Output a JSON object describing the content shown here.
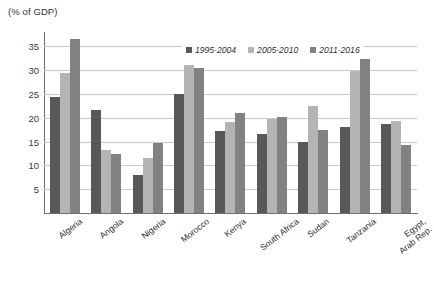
{
  "chart_data": {
    "type": "bar",
    "title": "",
    "ylabel": "(% of GDP)",
    "xlabel": "",
    "ylim": [
      0,
      38
    ],
    "yticks": [
      5,
      10,
      15,
      20,
      25,
      30,
      35
    ],
    "grid": true,
    "legend_position": "top-center",
    "categories": [
      "Algeria",
      "Angola",
      "Nigeria",
      "Morocco",
      "Kenya",
      "South Africa",
      "Sudan",
      "Tanzania",
      "Egypt, Arab Rep."
    ],
    "series": [
      {
        "name": "1995-2004",
        "color": "#585859",
        "values": [
          24.3,
          21.7,
          8.0,
          25.0,
          17.3,
          16.5,
          15.0,
          18.0,
          18.6
        ]
      },
      {
        "name": "2005-2010",
        "color": "#b4b4b4",
        "values": [
          29.3,
          13.3,
          11.6,
          31.1,
          19.2,
          19.8,
          22.4,
          29.8,
          19.3
        ]
      },
      {
        "name": "2011-2016",
        "color": "#828285",
        "values": [
          36.5,
          12.3,
          14.7,
          30.5,
          20.9,
          20.1,
          17.5,
          32.3,
          14.2
        ]
      }
    ]
  },
  "labels": {
    "egypt_line1": "Egypt,",
    "egypt_line2": "Arab Rep."
  }
}
